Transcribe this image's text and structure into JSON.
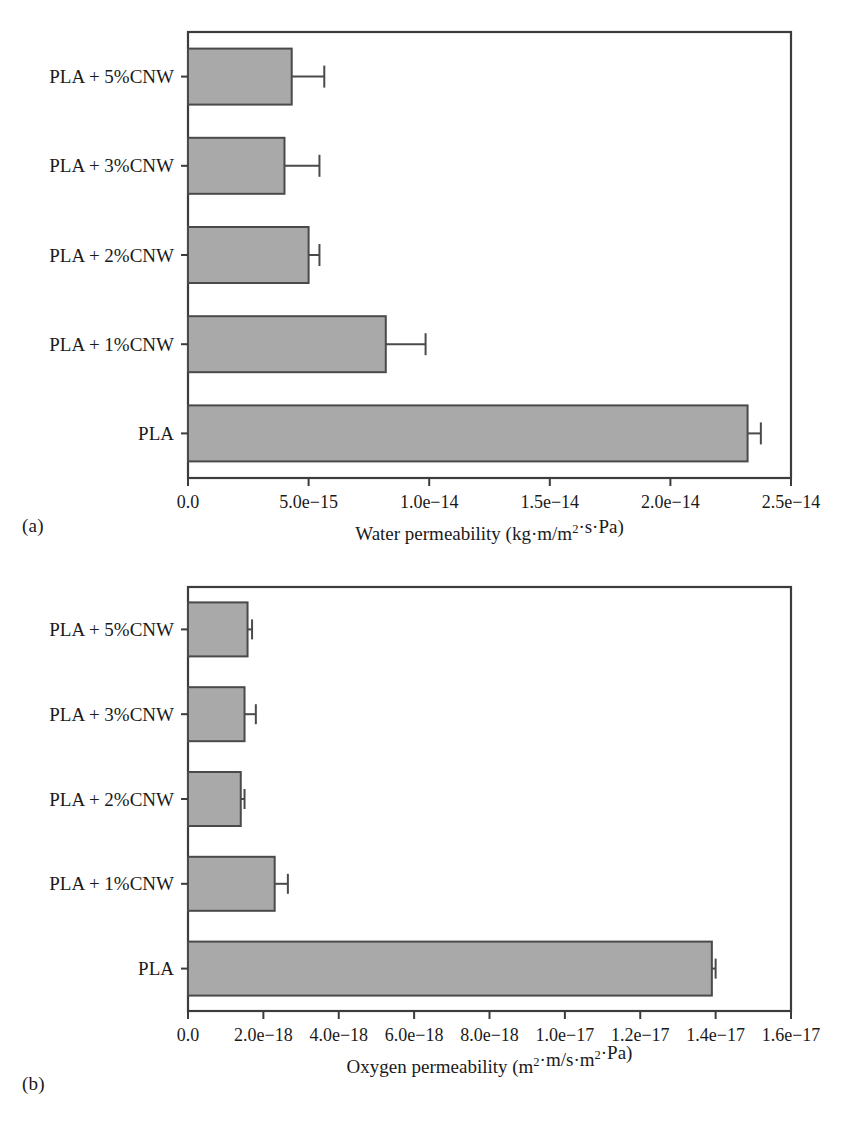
{
  "figure": {
    "background": "#ffffff",
    "bar_fill": "#a9a9a9",
    "bar_stroke": "#4a4a4a",
    "axis_color": "#3c3c3c",
    "text_color": "#1a1a1a"
  },
  "panels": [
    {
      "tag": "(a)",
      "axis_title_prefix": "Water permeability (kg",
      "axis_title_mid": "m/m",
      "axis_title_sup": "2",
      "axis_title_suffix": "s",
      "axis_title_end": "Pa)",
      "chart_ref": 0
    },
    {
      "tag": "(b)",
      "axis_title_prefix": "Oxygen permeability (m",
      "axis_title_sup": "2",
      "axis_title_mid": "m/s",
      "axis_title_sup2": "2",
      "axis_title_mid2": "m",
      "axis_title_end": "Pa)",
      "chart_ref": 1
    }
  ],
  "chart_data": [
    {
      "type": "bar",
      "orientation": "horizontal",
      "title": "",
      "xlabel": "Water permeability (kg·m/m²·s·Pa)",
      "ylabel": "",
      "xlim": [
        0,
        2.5e-14
      ],
      "xticks": [
        0,
        5e-15,
        1e-14,
        1.5e-14,
        2e-14,
        2.5e-14
      ],
      "xtick_labels": [
        "0.0",
        "5.0e−15",
        "1.0e−14",
        "1.5e−14",
        "2.0e−14",
        "2.5e−14"
      ],
      "categories": [
        "PLA + 5%CNW",
        "PLA + 3%CNW",
        "PLA + 2%CNW",
        "PLA + 1%CNW",
        "PLA"
      ],
      "values": [
        4.3e-15,
        4e-15,
        5e-15,
        8.2e-15,
        2.32e-14
      ],
      "errors": [
        1.35e-15,
        1.45e-15,
        4.5e-16,
        1.65e-15,
        5.5e-16
      ],
      "grid": false,
      "legend": "none"
    },
    {
      "type": "bar",
      "orientation": "horizontal",
      "title": "",
      "xlabel": "Oxygen permeability (m²·m/s·m²·Pa)",
      "ylabel": "",
      "xlim": [
        0,
        1.6e-17
      ],
      "xticks": [
        0,
        2e-18,
        4e-18,
        6e-18,
        8e-18,
        1e-17,
        1.2e-17,
        1.4e-17,
        1.6e-17
      ],
      "xtick_labels": [
        "0.0",
        "2.0e−18",
        "4.0e−18",
        "6.0e−18",
        "8.0e−18",
        "1.0e−17",
        "1.2e−17",
        "1.4e−17",
        "1.6e−17"
      ],
      "categories": [
        "PLA + 5%CNW",
        "PLA + 3%CNW",
        "PLA + 2%CNW",
        "PLA + 1%CNW",
        "PLA"
      ],
      "values": [
        1.58e-18,
        1.5e-18,
        1.4e-18,
        2.3e-18,
        1.39e-17
      ],
      "errors": [
        1.2e-19,
        3e-19,
        1e-19,
        3.5e-19,
        1e-19
      ],
      "grid": false,
      "legend": "none"
    }
  ]
}
